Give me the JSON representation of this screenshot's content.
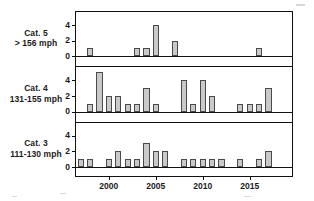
{
  "chart_data": {
    "type": "bar",
    "title": "",
    "subtitle": "",
    "xlabel": "",
    "ylabel": "",
    "layout": "stacked-panels",
    "grid": false,
    "legend": "none",
    "xlim": [
      1996.4,
      2019.6
    ],
    "xticks": [
      2000,
      2005,
      2010,
      2015
    ],
    "xtick_labels": [
      "2000",
      "2005",
      "2010",
      "2015"
    ],
    "ylim": [
      0,
      5
    ],
    "yticks": [
      0,
      2,
      4
    ],
    "ytick_labels": [
      "0",
      "2",
      "4"
    ],
    "panels": [
      {
        "id": "cat5",
        "label_line1": "Cat. 5",
        "label_line2": "> 156 mph",
        "categories": [
          1998,
          2003,
          2004,
          2005,
          2007,
          2016
        ],
        "values": [
          1,
          1,
          1,
          4,
          2,
          1
        ]
      },
      {
        "id": "cat4",
        "label_line1": "Cat. 4",
        "label_line2": "131-155 mph",
        "categories": [
          1998,
          1999,
          2000,
          2001,
          2002,
          2003,
          2004,
          2005,
          2008,
          2009,
          2010,
          2011,
          2014,
          2015,
          2016,
          2017
        ],
        "values": [
          1,
          5,
          2,
          2,
          1,
          1,
          3,
          1,
          4,
          1,
          4,
          2,
          1,
          1,
          1,
          3
        ]
      },
      {
        "id": "cat3",
        "label_line1": "Cat. 3",
        "label_line2": "111-130 mph",
        "categories": [
          1997,
          1998,
          2000,
          2001,
          2002,
          2003,
          2004,
          2005,
          2006,
          2008,
          2009,
          2010,
          2011,
          2012,
          2014,
          2016,
          2017
        ],
        "values": [
          1,
          1,
          1,
          2,
          1,
          1,
          3,
          2,
          2,
          1,
          1,
          1,
          1,
          1,
          1,
          1,
          2
        ]
      }
    ],
    "colors": {
      "bar_fill": "#c9c9c9",
      "bar_stroke": "#4a4a4a",
      "axis": "#111111",
      "background": "#ffffff",
      "text": "#1a1a1a"
    }
  }
}
